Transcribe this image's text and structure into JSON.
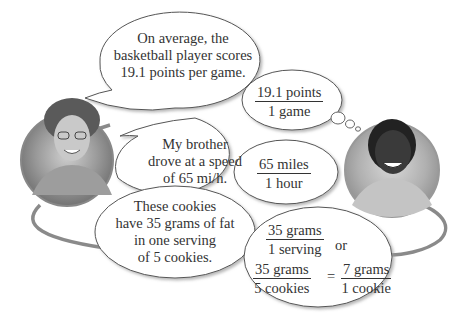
{
  "people": {
    "girl": {
      "description": "smiling girl with glasses and long hair, grayscale portrait"
    },
    "boy": {
      "description": "smiling boy with braided hair in collared shirt, grayscale portrait"
    }
  },
  "statements": {
    "basketball": {
      "lines": [
        "On average, the",
        "basketball player scores",
        "19.1 points per game."
      ]
    },
    "driving": {
      "lines": [
        "My brother",
        "drove at a speed",
        "of 65 mi/h."
      ]
    },
    "cookies": {
      "lines": [
        "These cookies",
        "have 35 grams of fat",
        "in one serving",
        "of 5 cookies."
      ]
    }
  },
  "rates": {
    "points": {
      "numerator": "19.1 points",
      "denominator": "1 game"
    },
    "speed": {
      "numerator": "65 miles",
      "denominator": "1 hour"
    },
    "fat_a": {
      "numerator": "35 grams",
      "denominator": "1 serving"
    },
    "or_label": "or",
    "fat_b": {
      "numerator": "35 grams",
      "denominator": "5 cookies"
    },
    "equals": "=",
    "fat_c": {
      "numerator": "7 grams",
      "denominator": "1 cookie"
    }
  },
  "colors": {
    "bubble_stroke": "#555555",
    "loop_line": "#8a8a8a",
    "shadow": "#bdbdbd"
  }
}
